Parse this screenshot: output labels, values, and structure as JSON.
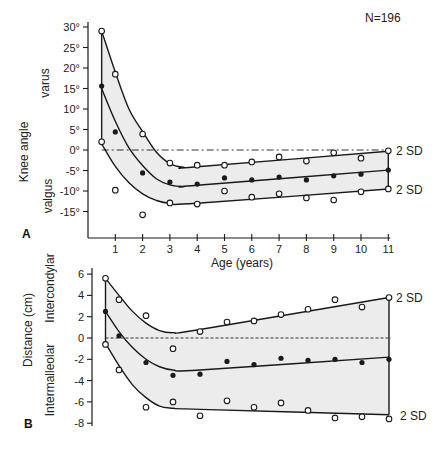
{
  "figure": {
    "n_label": "N=196",
    "shared_xlabel": "Age (years)",
    "band_color": "#ececec",
    "line_color": "#1a1a1a"
  },
  "chart_data": [
    {
      "panel": "A",
      "type": "line",
      "title": "",
      "xlabel": "Age (years)",
      "ylabel": "Knee angle",
      "ylabel_sub_top": "varus",
      "ylabel_sub_bottom": "valgus",
      "annotation": "N=196",
      "band_labels": [
        "2 SD",
        "2 SD"
      ],
      "xlim": [
        0,
        11
      ],
      "ylim": [
        -15,
        30
      ],
      "x_ticks": [
        "1",
        "2",
        "3",
        "4",
        "5",
        "6",
        "7",
        "8",
        "9",
        "10",
        "11"
      ],
      "y_ticks": [
        "30°",
        "25°",
        "20°",
        "15°",
        "10°",
        "5°",
        "0°",
        "-5°",
        "-10°",
        "-15°"
      ],
      "y_tick_values": [
        30,
        25,
        20,
        15,
        10,
        5,
        0,
        -5,
        -10,
        -15
      ],
      "reference_line": {
        "y": 0,
        "style": "dash-dot"
      },
      "x": [
        0.5,
        1,
        2,
        3,
        4,
        5,
        6,
        7,
        8,
        9,
        10,
        11
      ],
      "series": [
        {
          "name": "Upper 2 SD (observed, open circles)",
          "marker": "open",
          "values": [
            29,
            18.5,
            3.9,
            -3.2,
            -3.7,
            -3.7,
            -2.9,
            -1.7,
            -2.7,
            -0.7,
            -2.0,
            -0.2
          ]
        },
        {
          "name": "Mean (observed, filled circles)",
          "marker": "filled",
          "values": [
            15.6,
            4.4,
            -5.6,
            -7.8,
            -8.3,
            -6.8,
            -7.3,
            -6.6,
            -7.3,
            -6.3,
            -5.9,
            -4.9
          ]
        },
        {
          "name": "Lower 2 SD (observed, open circles)",
          "marker": "open",
          "values": [
            2.0,
            -9.8,
            -15.8,
            -12.9,
            -13.2,
            -10.0,
            -11.5,
            -10.7,
            -11.7,
            -12.2,
            -10.2,
            -9.5
          ]
        }
      ],
      "fitted_curves": {
        "upper": [
          [
            0.5,
            29
          ],
          [
            1,
            19
          ],
          [
            1.5,
            10
          ],
          [
            2,
            4.5
          ],
          [
            2.5,
            -0.5
          ],
          [
            3,
            -3.3
          ],
          [
            3.5,
            -4.2
          ],
          [
            4,
            -4.1
          ],
          [
            11,
            -0.3
          ]
        ],
        "mean": [
          [
            0.5,
            15
          ],
          [
            1,
            7
          ],
          [
            1.5,
            0.5
          ],
          [
            2,
            -3.8
          ],
          [
            2.5,
            -7
          ],
          [
            3,
            -8.5
          ],
          [
            3.5,
            -8.9
          ],
          [
            4,
            -8.6
          ],
          [
            11,
            -4.9
          ]
        ],
        "lower": [
          [
            0.5,
            1.5
          ],
          [
            1,
            -4
          ],
          [
            1.5,
            -8
          ],
          [
            2,
            -10.7
          ],
          [
            2.5,
            -12.3
          ],
          [
            3,
            -13
          ],
          [
            4,
            -13
          ],
          [
            11,
            -9.5
          ]
        ]
      }
    },
    {
      "panel": "B",
      "type": "line",
      "title": "",
      "xlabel": "Age (years)",
      "ylabel": "Distance (cm)",
      "ylabel_sub_top": "Intercondylar",
      "ylabel_sub_bottom": "Intermalleolar",
      "band_labels": [
        "2 SD",
        "2 SD"
      ],
      "xlim": [
        0,
        11
      ],
      "ylim": [
        -8,
        6
      ],
      "y_ticks": [
        "6",
        "4",
        "2",
        "0",
        "-2",
        "-4",
        "-6",
        "-8"
      ],
      "y_tick_values": [
        6,
        4,
        2,
        0,
        -2,
        -4,
        -6,
        -8
      ],
      "reference_line": {
        "y": 0,
        "style": "dotted"
      },
      "x": [
        0.5,
        1,
        2,
        3,
        4,
        5,
        6,
        7,
        8,
        9,
        10,
        11
      ],
      "series": [
        {
          "name": "Upper 2 SD (observed, open circles)",
          "marker": "open",
          "values": [
            5.6,
            3.6,
            2.1,
            -1.0,
            0.6,
            1.5,
            1.6,
            2.2,
            2.7,
            3.6,
            2.9,
            3.8
          ]
        },
        {
          "name": "Mean (observed, filled circles)",
          "marker": "filled",
          "values": [
            2.5,
            0.2,
            -2.3,
            -3.5,
            -3.4,
            -2.2,
            -2.5,
            -1.9,
            -2.1,
            -2.0,
            -2.3,
            -2.0
          ]
        },
        {
          "name": "Lower 2 SD (observed, open circles)",
          "marker": "open",
          "values": [
            -0.6,
            -3.0,
            -6.5,
            -6.0,
            -7.3,
            -5.9,
            -6.5,
            -6.1,
            -6.8,
            -7.5,
            -7.4,
            -7.6
          ]
        }
      ],
      "extra_points_lower": [
        [
          4,
          -7.3
        ],
        [
          6,
          -6.5
        ],
        [
          7,
          -6.1
        ]
      ],
      "fitted_curves": {
        "upper": [
          [
            0.5,
            5.6
          ],
          [
            1,
            4
          ],
          [
            1.5,
            2.5
          ],
          [
            2,
            1.4
          ],
          [
            2.5,
            0.7
          ],
          [
            3,
            0.5
          ],
          [
            4,
            0.8
          ],
          [
            11,
            3.8
          ]
        ],
        "mean": [
          [
            0.5,
            2.5
          ],
          [
            1,
            0.6
          ],
          [
            1.5,
            -0.9
          ],
          [
            2,
            -2
          ],
          [
            2.5,
            -2.7
          ],
          [
            3,
            -3
          ],
          [
            4,
            -3
          ],
          [
            11,
            -1.8
          ]
        ],
        "lower": [
          [
            0.5,
            -0.5
          ],
          [
            1,
            -2.6
          ],
          [
            1.5,
            -4.4
          ],
          [
            2,
            -5.6
          ],
          [
            2.5,
            -6.4
          ],
          [
            3,
            -6.6
          ],
          [
            4,
            -6.7
          ],
          [
            11,
            -7.2
          ]
        ]
      }
    }
  ]
}
